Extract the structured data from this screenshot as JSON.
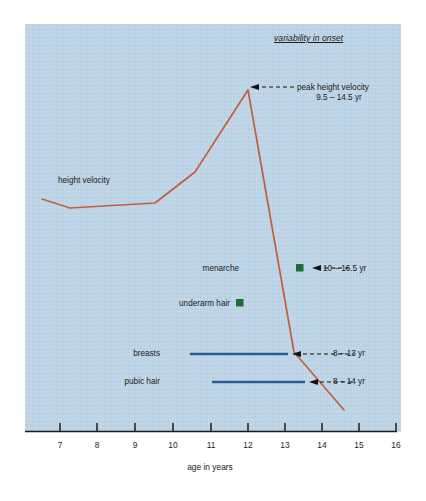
{
  "figure": {
    "background_color": "#bfd7ea",
    "curve_color": "#c0603f",
    "bar_color": "#2a5d96",
    "marker_color": "#1a6e32",
    "axis_color": "#1b1b1b"
  },
  "legend": {
    "title": "variability in onset"
  },
  "axis": {
    "title": "age in years",
    "ticks": [
      {
        "value": 7,
        "label": "7",
        "x": 60
      },
      {
        "value": 8,
        "label": "8",
        "x": 97
      },
      {
        "value": 9,
        "label": "9",
        "x": 135
      },
      {
        "value": 10,
        "label": "10",
        "x": 173
      },
      {
        "value": 11,
        "label": "11",
        "x": 211
      },
      {
        "value": 12,
        "label": "12",
        "x": 248
      },
      {
        "value": 13,
        "label": "13",
        "x": 285
      },
      {
        "value": 14,
        "label": "14",
        "x": 322
      },
      {
        "value": 15,
        "label": "15",
        "x": 359
      },
      {
        "value": 16,
        "label": "16",
        "x": 396
      }
    ]
  },
  "annotations": {
    "peak_height_velocity": {
      "label": "peak height velocity",
      "range": "9.5 – 14.5 yr"
    },
    "menarche": {
      "label": "menarche",
      "range": "10 – 16.5 yr"
    },
    "underarm_hair": {
      "label": "underarm hair"
    },
    "breasts": {
      "label": "breasts",
      "range": "8 – 13 yr"
    },
    "pubic_hair": {
      "label": "pubic hair",
      "range": "8 – 14 yr"
    },
    "height_velocity": {
      "label": "height velocity"
    }
  },
  "chart_data": {
    "type": "line",
    "title": "",
    "xlabel": "age in years",
    "ylabel": "height velocity (unlabeled)",
    "xlim": [
      6.3,
      16
    ],
    "grid": false,
    "legend_position": "top-right",
    "legend_title": "variability in onset",
    "series": [
      {
        "name": "height velocity",
        "type": "line",
        "color": "#c0603f",
        "points": [
          {
            "age": 6.75,
            "y_px": 199
          },
          {
            "age": 7.5,
            "y_px": 208
          },
          {
            "age": 9.5,
            "y_px": 203
          },
          {
            "age": 10.6,
            "y_px": 172
          },
          {
            "age": 12.0,
            "y_px": 90
          },
          {
            "age": 13.25,
            "y_px": 352
          },
          {
            "age": 14.55,
            "y_px": 410
          }
        ]
      }
    ],
    "event_bars": [
      {
        "name": "breasts",
        "type": "range-bar",
        "color": "#2a5d96",
        "start_age": 10.4,
        "end_age": 13.0,
        "range_label": "8 – 13 yr"
      },
      {
        "name": "pubic hair",
        "type": "range-bar",
        "color": "#2a5d96",
        "start_age": 11.0,
        "end_age": 13.45,
        "range_label": "8 – 14 yr"
      }
    ],
    "event_markers": [
      {
        "name": "menarche",
        "type": "square-marker",
        "color": "#1a6e32",
        "age": 13.45,
        "range_label": "10 – 16.5 yr"
      },
      {
        "name": "underarm hair",
        "type": "square-marker",
        "color": "#1a6e32",
        "age": 11.85,
        "range_label": ""
      }
    ],
    "peak": {
      "name": "peak height velocity",
      "age": 12.0,
      "range_label": "9.5 – 14.5 yr"
    }
  }
}
